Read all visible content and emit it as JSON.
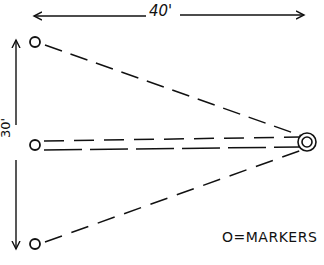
{
  "diagram": {
    "type": "marker-layout",
    "style": "hand-drawn line sketch",
    "dimensions": {
      "width_label": "40'",
      "height_label": "30'"
    },
    "legend": {
      "text": "O=MARKERS"
    },
    "markers": [
      {
        "id": "top-left",
        "x": 35,
        "y": 42
      },
      {
        "id": "middle-left",
        "x": 35,
        "y": 145
      },
      {
        "id": "bottom-left",
        "x": 35,
        "y": 244
      }
    ],
    "focal_point": {
      "id": "right-apex",
      "x": 306,
      "y": 142,
      "style": "double-circle"
    },
    "connections": [
      {
        "from": "top-left",
        "to": "right-apex",
        "style": "dashed"
      },
      {
        "from": "middle-left",
        "to": "right-apex",
        "style": "dashed-double"
      },
      {
        "from": "bottom-left",
        "to": "right-apex",
        "style": "dashed"
      }
    ],
    "colors": {
      "ink": "#111111",
      "paper": "#ffffff"
    }
  }
}
